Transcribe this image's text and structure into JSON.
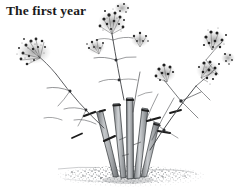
{
  "figure": {
    "caption": "The first year",
    "background_color": "#ffffff",
    "width": 239,
    "height": 192,
    "ink_color": "#2b2b2b",
    "stem_fill_color": "#b9bcbf",
    "ground_color": "#8e9194",
    "elements": [
      {
        "name": "caption-label",
        "label": "The first year"
      },
      {
        "name": "gravel-ground",
        "label": "stippled gravel ground"
      },
      {
        "name": "stem-clump",
        "label": "clump of cut thick stems"
      },
      {
        "name": "flower-umbel",
        "label": "stippled umbel flower head"
      },
      {
        "name": "stem-node",
        "label": "dark pruning node mark"
      }
    ]
  }
}
